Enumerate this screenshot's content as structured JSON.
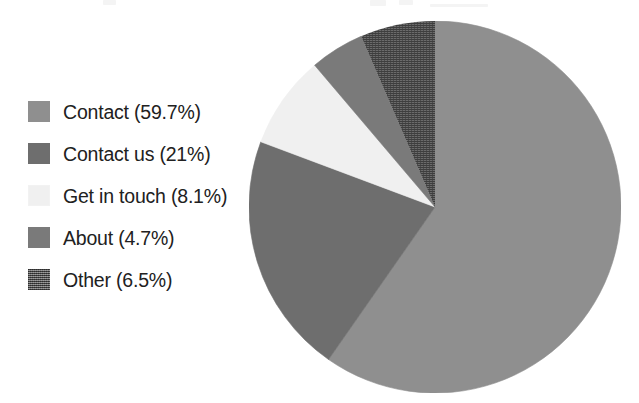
{
  "chart_data": {
    "type": "pie",
    "title": "",
    "subtitle": "",
    "xlabel": "",
    "ylabel": "",
    "legend_position": "left",
    "grid": false,
    "start_angle_deg": 0,
    "direction": "clockwise",
    "units": "percent",
    "categories": [
      "Contact",
      "Contact us",
      "Get in touch",
      "About",
      "Other"
    ],
    "values": [
      59.7,
      21.0,
      8.1,
      4.7,
      6.5
    ],
    "labels": [
      "Contact (59.7%)",
      "Contact us (21%)",
      "Get in touch (8.1%)",
      "About (4.7%)",
      "Other (6.5%)"
    ],
    "colors": [
      "#8f8f8f",
      "#6e6e6e",
      "#f0f0f0",
      "#7a7a7a",
      "#5d5d5d"
    ],
    "fill_styles": [
      "solid",
      "solid",
      "solid",
      "solid",
      "dither"
    ],
    "slices": [
      {
        "name": "Contact",
        "value": 59.7,
        "label": "Contact (59.7%)",
        "color": "#8f8f8f",
        "fill": "solid"
      },
      {
        "name": "Contact us",
        "value": 21.0,
        "label": "Contact us (21%)",
        "color": "#6e6e6e",
        "fill": "solid"
      },
      {
        "name": "Get in touch",
        "value": 8.1,
        "label": "Get in touch (8.1%)",
        "color": "#f0f0f0",
        "fill": "solid"
      },
      {
        "name": "About",
        "value": 4.7,
        "label": "About (4.7%)",
        "color": "#7a7a7a",
        "fill": "solid"
      },
      {
        "name": "Other",
        "value": 6.5,
        "label": "Other (6.5%)",
        "color": "#5d5d5d",
        "fill": "dither"
      }
    ]
  },
  "legend": {
    "items": [
      {
        "label": "Contact (59.7%)",
        "color": "#8f8f8f",
        "swatch": "legend-swatch-contact"
      },
      {
        "label": "Contact us (21%)",
        "color": "#6e6e6e",
        "swatch": "legend-swatch-contact-us"
      },
      {
        "label": "Get in touch (8.1%)",
        "color": "#f0f0f0",
        "swatch": "legend-swatch-get-in-touch"
      },
      {
        "label": "About (4.7%)",
        "color": "#7a7a7a",
        "swatch": "legend-swatch-about"
      },
      {
        "label": "Other (6.5%)",
        "color": "#5d5d5d",
        "swatch": "legend-swatch-other"
      }
    ]
  },
  "colors": {
    "background": "#ffffff",
    "text": "#212121",
    "slice_1": "#8f8f8f",
    "slice_2": "#6e6e6e",
    "slice_3": "#f0f0f0",
    "slice_4": "#7a7a7a",
    "slice_5": "#5d5d5d"
  }
}
